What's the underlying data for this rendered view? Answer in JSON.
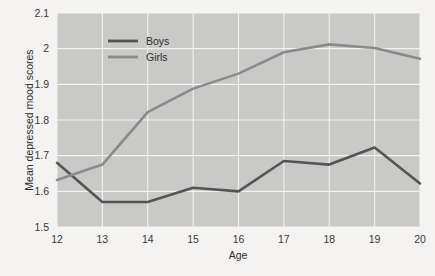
{
  "chart_data": {
    "type": "line",
    "title": "",
    "xlabel": "Age",
    "ylabel": "Mean depressed mood scores",
    "categories": [
      12,
      13,
      14,
      15,
      16,
      17,
      18,
      19,
      20
    ],
    "x": [
      12,
      13,
      14,
      15,
      16,
      17,
      18,
      19,
      20
    ],
    "xlim": [
      12,
      20
    ],
    "ylim": [
      1.5,
      2.1
    ],
    "xticks": [
      "12",
      "13",
      "14",
      "15",
      "16",
      "17",
      "18",
      "19",
      "20"
    ],
    "yticks": [
      "1.5",
      "1.6",
      "1.7",
      "1.8",
      "1.9",
      "2",
      "2.1"
    ],
    "ytick_values": [
      1.5,
      1.6,
      1.7,
      1.8,
      1.9,
      2.0,
      2.1
    ],
    "grid": true,
    "legend_position": "top-left-inside",
    "series": [
      {
        "name": "Boys",
        "color": "#555555",
        "values": [
          1.68,
          1.57,
          1.57,
          1.61,
          1.6,
          1.685,
          1.675,
          1.723,
          1.622
        ]
      },
      {
        "name": "Girls",
        "color": "#8a8a8a",
        "values": [
          1.632,
          1.675,
          1.822,
          1.888,
          1.93,
          1.99,
          2.012,
          2.002,
          1.972
        ]
      }
    ]
  },
  "legend": {
    "items": [
      {
        "label": "Boys",
        "color": "#555555"
      },
      {
        "label": "Girls",
        "color": "#8a8a8a"
      }
    ]
  },
  "axes": {
    "x_title": "Age",
    "y_title": "Mean depressed mood scores"
  },
  "colors": {
    "page_background": "#f4f3f1",
    "plot_background": "#c9c9c7",
    "gridline": "#f2f2f0",
    "boys": "#555555",
    "girls": "#8a8a8a",
    "text": "#2e2e2e"
  }
}
